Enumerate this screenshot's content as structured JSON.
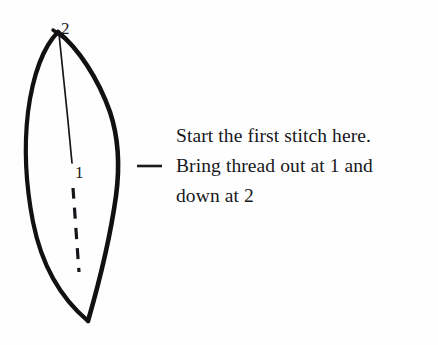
{
  "figure": {
    "name": "first-stitch-diagram",
    "background_color": "#fefefe",
    "ink_color": "#111114",
    "text_color": "#17171b"
  },
  "diagram": {
    "shape_name": "leaf-petal-outline",
    "labels": {
      "point_top": "2",
      "point_middle": "1"
    },
    "guide_line": {
      "name": "solid-thread-line",
      "from_label": "2",
      "to_label": "1",
      "style": "solid"
    },
    "dashed_line": {
      "name": "dashed-thread-path",
      "style": "dashed",
      "segment_count": 5
    },
    "leader": {
      "name": "caption-leader-dash",
      "style": "solid-horizontal"
    }
  },
  "caption": {
    "lines": [
      "Start the first stitch here.",
      "Bring thread out at 1 and",
      "down at 2"
    ]
  }
}
